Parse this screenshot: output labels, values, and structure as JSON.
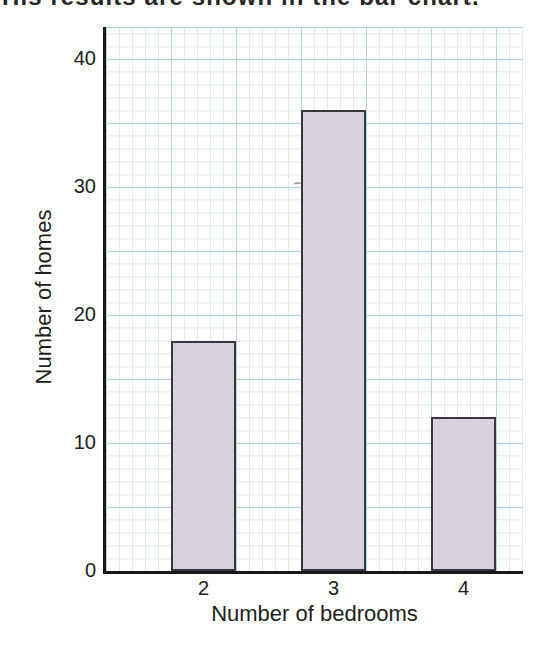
{
  "page": {
    "intro_text": "His results are shown in the bar chart."
  },
  "chart_data": {
    "type": "bar",
    "title": "",
    "categories": [
      "2",
      "3",
      "4"
    ],
    "values": [
      18,
      36,
      12
    ],
    "xlabel": "Number of bedrooms",
    "ylabel": "Number of homes",
    "ylim": [
      0,
      42.5
    ],
    "yticks": [
      40,
      30,
      20,
      10,
      0
    ],
    "grid": "graph-paper (minor every 1 unit, major every 5 units)",
    "legend": "none",
    "colors": {
      "bar_fill": "#d7d2de",
      "bar_border": "#39353c",
      "grid_major": "#aed9e3",
      "grid_minor": "#dfebee",
      "axis": "#1b181c",
      "text": "#221e20"
    }
  }
}
